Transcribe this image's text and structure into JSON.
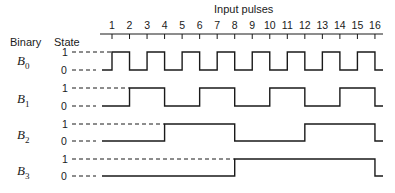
{
  "title": "Input pulses",
  "headers": {
    "binary": "Binary",
    "state": "State"
  },
  "pulses": [
    "1",
    "2",
    "3",
    "4",
    "5",
    "6",
    "7",
    "8",
    "9",
    "10",
    "11",
    "12",
    "13",
    "14",
    "15",
    "16"
  ],
  "signals": [
    {
      "name": "B",
      "sub": "0",
      "high": "1",
      "low": "0"
    },
    {
      "name": "B",
      "sub": "1",
      "high": "1",
      "low": "0"
    },
    {
      "name": "B",
      "sub": "2",
      "high": "1",
      "low": "0"
    },
    {
      "name": "B",
      "sub": "3",
      "high": "1",
      "low": "0"
    }
  ],
  "chart_data": {
    "type": "timing",
    "title": "Input pulses",
    "x": [
      1,
      2,
      3,
      4,
      5,
      6,
      7,
      8,
      9,
      10,
      11,
      12,
      13,
      14,
      15,
      16
    ],
    "series": [
      {
        "name": "B0",
        "values": [
          1,
          0,
          1,
          0,
          1,
          0,
          1,
          0,
          1,
          0,
          1,
          0,
          1,
          0,
          1,
          0
        ]
      },
      {
        "name": "B1",
        "values": [
          0,
          1,
          1,
          0,
          0,
          1,
          1,
          0,
          0,
          1,
          1,
          0,
          0,
          1,
          1,
          0
        ]
      },
      {
        "name": "B2",
        "values": [
          0,
          0,
          0,
          1,
          1,
          1,
          1,
          0,
          0,
          0,
          0,
          1,
          1,
          1,
          1,
          0
        ]
      },
      {
        "name": "B3",
        "values": [
          0,
          0,
          0,
          0,
          0,
          0,
          0,
          1,
          1,
          1,
          1,
          1,
          1,
          1,
          1,
          0
        ]
      }
    ],
    "note": "Values give the state of each bit after the corresponding input pulse edge (binary counter 0..15 wrapping to 0 at pulse 16).",
    "ylabel": "State",
    "rows_label": "Binary"
  }
}
